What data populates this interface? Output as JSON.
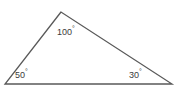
{
  "figure": {
    "background_color": "#ffffff",
    "stroke_color": "#595959",
    "text_color": "#3b3b3b"
  },
  "shape": {
    "type": "triangle",
    "vertices": [
      {
        "name": "apex",
        "x": 61,
        "y": 12
      },
      {
        "name": "bottom-left",
        "x": 5,
        "y": 84
      },
      {
        "name": "bottom-right",
        "x": 172,
        "y": 84
      }
    ]
  },
  "angles": {
    "apex": {
      "value": 100,
      "text": "100",
      "degree_symbol": "°"
    },
    "bottom_left": {
      "value": 50,
      "text": "50",
      "degree_symbol": "°"
    },
    "bottom_right": {
      "value": 30,
      "text": "30",
      "degree_symbol": "°"
    }
  }
}
